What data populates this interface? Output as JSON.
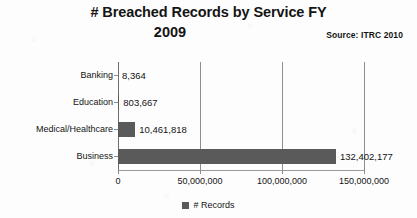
{
  "title": {
    "line1": "# Breached Records by Service FY",
    "line2": "2009"
  },
  "source": "Source: ITRC 2010",
  "legend": {
    "label": "# Records",
    "swatch_color": "#5a5a5a"
  },
  "axis": {
    "ticks": [
      "0",
      "50,000,000",
      "100,000,000",
      "150,000,000"
    ]
  },
  "chart_data": {
    "type": "bar",
    "orientation": "horizontal",
    "title": "# Breached Records by Service FY 2009",
    "subtitle": "Source: ITRC 2010",
    "xlabel": "",
    "ylabel": "",
    "categories": [
      "Banking",
      "Education",
      "Medical/Healthcare",
      "Business"
    ],
    "values": [
      8364,
      803667,
      10461818,
      132402177
    ],
    "value_labels": [
      "8,364",
      "803,667",
      "10,461,818",
      "132,402,177"
    ],
    "series": [
      {
        "name": "# Records",
        "values": [
          8364,
          803667,
          10461818,
          132402177
        ],
        "color": "#5a5a5a"
      }
    ],
    "xlim": [
      0,
      150000000
    ],
    "xticks": [
      0,
      50000000,
      100000000,
      150000000
    ],
    "xtick_labels": [
      "0",
      "50,000,000",
      "100,000,000",
      "150,000,000"
    ],
    "grid": "vertical",
    "legend_position": "bottom",
    "data_labels": true
  }
}
